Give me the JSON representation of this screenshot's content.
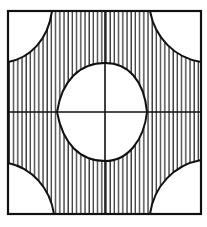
{
  "diagram": {
    "colors": {
      "stroke": "#111111",
      "hatch": "#222222",
      "background": "#ffffff"
    },
    "square": {
      "x": 8,
      "y": 11,
      "width": 193,
      "height": 203
    },
    "axes": {
      "vertical_x": 105,
      "horizontal_y": 112
    },
    "hatch_spacing": 4.2
  }
}
